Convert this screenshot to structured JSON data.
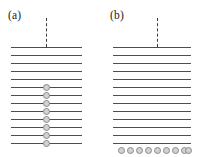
{
  "figure": {
    "width": 204,
    "height": 157,
    "background": "#ffffff",
    "line_color": "#4d4d4d",
    "dash_color": "#3a3a3a",
    "node_fill": "#d2d2d2",
    "node_stroke": "#8a8a8a",
    "label_color": "#1a1a1a"
  },
  "panels": [
    {
      "id": "a",
      "label": "(a)",
      "label_x": 8,
      "label_y": 10,
      "dashed": {
        "x": 46,
        "y_top": 18,
        "y_bottom": 47
      },
      "lines_x_start": 11,
      "lines_x_end": 82,
      "line_count": 13,
      "line_y": [
        47,
        55,
        63,
        71,
        79,
        87,
        95,
        103,
        111,
        119,
        127,
        135,
        143
      ],
      "node_layout": "vertical-column",
      "node_count": 8,
      "node_diameter": 7,
      "node_x": [
        46
      ],
      "node_y": [
        87,
        95,
        103,
        111,
        119,
        127,
        135,
        143
      ]
    },
    {
      "id": "b",
      "label": "(b)",
      "label_x": 8,
      "label_y": 10,
      "dashed": {
        "x": 55,
        "y_top": 18,
        "y_bottom": 47
      },
      "lines_x_start": 11,
      "lines_x_end": 89,
      "line_count": 13,
      "line_y": [
        47,
        55,
        63,
        71,
        79,
        87,
        95,
        103,
        111,
        119,
        127,
        135,
        143
      ],
      "node_layout": "horizontal-row",
      "node_count": 9,
      "node_diameter": 7,
      "node_x": [
        19,
        28,
        37,
        46,
        55,
        64,
        73,
        82,
        86
      ],
      "node_y": [
        150
      ]
    }
  ]
}
